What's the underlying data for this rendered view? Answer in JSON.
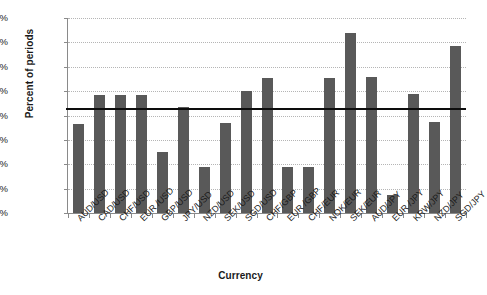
{
  "chart_data": {
    "type": "bar",
    "title": "",
    "xlabel": "Currency",
    "ylabel": "Percent of periods",
    "ylim": [
      0,
      16
    ],
    "ytick_labels": [
      "0.0%",
      "2.0%",
      "4.0%",
      "6.0%",
      "8.0%",
      "10.0%",
      "12.0%",
      "14.0%",
      "16.0%"
    ],
    "ytick_values": [
      0,
      2,
      4,
      6,
      8,
      10,
      12,
      14,
      16
    ],
    "grid": true,
    "legend": "none",
    "bar_color": "#595959",
    "reference_line": {
      "value": 8.6,
      "color": "#0d0d0d",
      "label": ""
    },
    "categories": [
      "AUD/USD",
      "CAD/USD",
      "CHF/USD",
      "EUR /USD",
      "GBP/USD",
      "JPY/USD",
      "NZD/USD",
      "SEK/USD",
      "SGD/USD",
      "CHF/GBP",
      "EUR /GBP",
      "CHF/EUR",
      "NOK/EUR",
      "SEK/EUR",
      "AUD/JPY",
      "EUR /JPY",
      "KRW/JPY",
      "NZD/JPY",
      "SGD/JPY"
    ],
    "values": [
      7.3,
      9.7,
      9.7,
      9.7,
      5.0,
      8.7,
      3.8,
      7.4,
      10.0,
      11.1,
      3.8,
      3.8,
      11.1,
      14.8,
      11.2,
      1.5,
      9.8,
      7.5,
      13.7
    ],
    "series_note": "Percent of periods by currency pair"
  },
  "axis": {
    "y_title": "Percent of periods",
    "x_title": "Currency"
  }
}
